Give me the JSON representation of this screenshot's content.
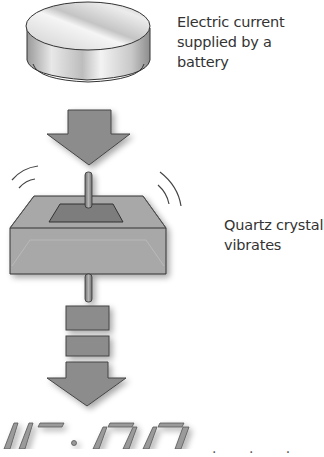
{
  "diagram": {
    "title": "",
    "steps": [
      {
        "id": "battery",
        "label_line1": "Electric current",
        "label_line2": "supplied by a battery"
      },
      {
        "id": "quartz",
        "label_line1": "Quartz crystal",
        "label_line2": "vibrates"
      },
      {
        "id": "display",
        "display_value": "10:07",
        "label_partial": ". . ."
      }
    ],
    "colors": {
      "arrow_fill": "#8c8c8c",
      "arrow_stroke": "#444444",
      "crystal_fill": "#a6a6a6",
      "battery_fill": "#d9d9d9",
      "text": "#333333"
    }
  }
}
